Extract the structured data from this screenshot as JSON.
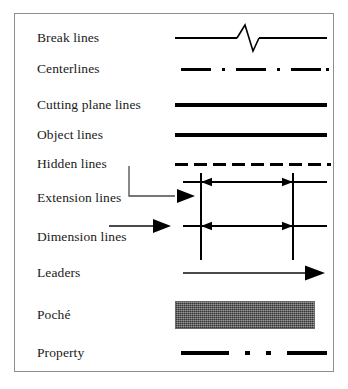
{
  "diagram": {
    "frame": {
      "border_color": "#8e8e8e",
      "background": "#ffffff"
    },
    "ink_color": "#000000",
    "callout_color": "#4a4a4a",
    "poche_fill": "#7d7d7d",
    "rows": [
      {
        "label": "Break lines",
        "sample_type": "break-line",
        "description": "Thin horizontal line interrupted by a zigzag break symbol near the middle",
        "y": 37,
        "line_weight": 1.6
      },
      {
        "label": "Centerlines",
        "sample_type": "centerline",
        "description": "Long dash, dot, long dash, dot, long dash, dot pattern",
        "y": 68,
        "line_weight": 3,
        "pattern": "dash-dot",
        "dashes": 3,
        "dots": 3
      },
      {
        "label": "Cutting plane lines",
        "sample_type": "cutting-plane-line",
        "description": "Very heavy continuous solid line",
        "y": 104,
        "line_weight": 4
      },
      {
        "label": "Object lines",
        "sample_type": "object-line",
        "description": "Heavy continuous solid line",
        "y": 134,
        "line_weight": 3.4
      },
      {
        "label": "Hidden lines",
        "sample_type": "hidden-line",
        "description": "Evenly spaced medium dashes",
        "y": 163,
        "line_weight": 3,
        "dash_count": 8
      },
      {
        "label": "Extension lines",
        "sample_type": "extension-lines",
        "description": "Short vertical witness lines at each end of the dimension, with a callout arrow from the label",
        "y": 197,
        "line_weight": 1.2,
        "callout": true
      },
      {
        "label": "Dimension lines",
        "sample_type": "dimension-lines",
        "description": "Horizontal line terminated with solid arrowheads at both ends, with a callout arrow from the label",
        "y": 236,
        "line_weight": 1.2,
        "callout": true
      },
      {
        "label": "Leaders",
        "sample_type": "leader",
        "description": "Thin straight line with a single solid arrowhead at the right end",
        "y": 272,
        "line_weight": 1.2
      },
      {
        "label": "Poché",
        "sample_type": "poche-swatch",
        "description": "Filled grey stippled rectangle indicating cut solid material",
        "y": 314,
        "swatch": {
          "width": 140,
          "height": 28,
          "fill": "#7d7d7d"
        }
      },
      {
        "label": "Property",
        "sample_type": "property-line",
        "description": "Heavy dash, dot, dot, heavy dash pattern",
        "y": 352,
        "line_weight": 4,
        "pattern": "dash-dot-dot-dash"
      }
    ]
  }
}
